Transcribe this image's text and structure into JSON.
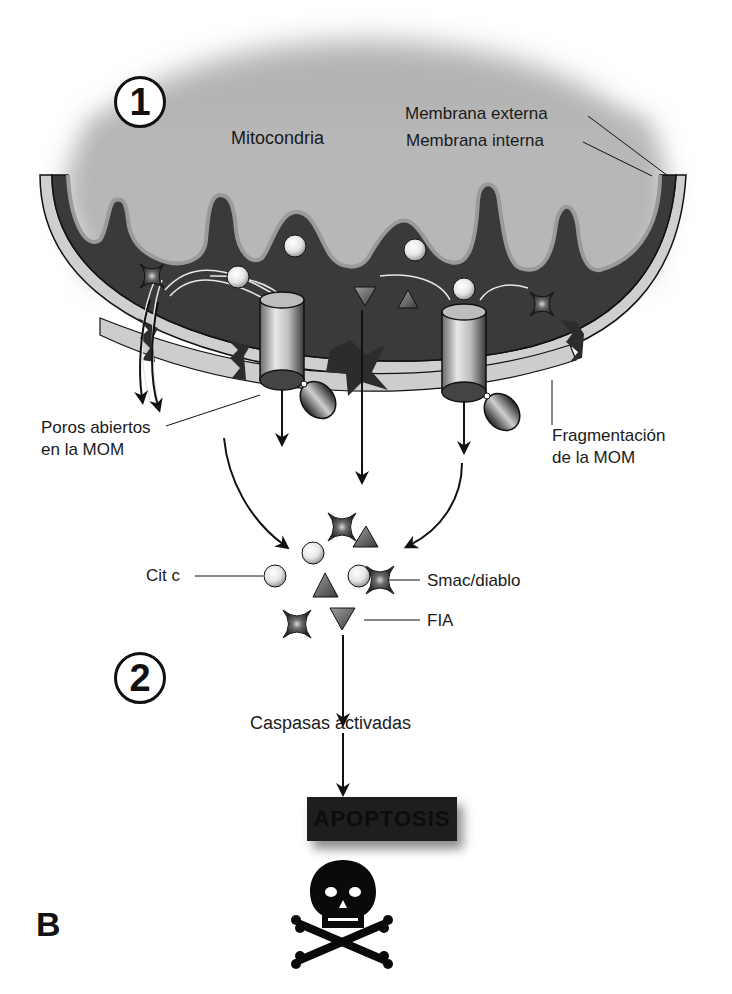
{
  "figure": {
    "panel_letter": "B",
    "steps": {
      "step1": "1",
      "step2": "2"
    },
    "labels": {
      "mitochondria": "Mitocondria",
      "outer_membrane": "Membrana externa",
      "inner_membrane": "Membrana interna",
      "open_pores_line1": "Poros abiertos",
      "open_pores_line2": "en la MOM",
      "fragmentation_line1": "Fragmentación",
      "fragmentation_line2": "de la MOM",
      "cyt_c": "Cit c",
      "smac": "Smac/diablo",
      "aif": "FIA",
      "caspases": "Caspasas activadas",
      "apoptosis": "APOPTOSIS"
    },
    "icons": {
      "cyt_c": "light-sphere",
      "smac": "four-point-star",
      "aif": "triangle",
      "death": "skull-and-crossbones"
    },
    "colors": {
      "matrix_gray": "#b9b9b9",
      "intermembrane_dark": "#3a3a3a",
      "outer_membrane_light": "#cfcfcf",
      "apoptosis_box": "#1e1e1e",
      "ink": "#111111"
    }
  }
}
